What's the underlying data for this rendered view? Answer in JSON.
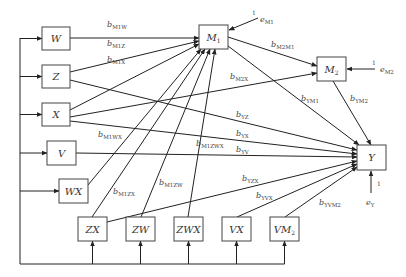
{
  "diagram": {
    "type": "path-model",
    "nodes": [
      {
        "id": "W",
        "label": "W",
        "x": 42,
        "y": 27,
        "w": 28,
        "h": 23
      },
      {
        "id": "Z",
        "label": "Z",
        "x": 42,
        "y": 65,
        "w": 28,
        "h": 23
      },
      {
        "id": "X",
        "label": "X",
        "x": 42,
        "y": 103,
        "w": 28,
        "h": 23
      },
      {
        "id": "V",
        "label": "V",
        "x": 47,
        "y": 141,
        "w": 29,
        "h": 24
      },
      {
        "id": "WX",
        "label": "WX",
        "x": 59,
        "y": 179,
        "w": 29,
        "h": 24
      },
      {
        "id": "ZX",
        "label": "ZX",
        "x": 78,
        "y": 217,
        "w": 29,
        "h": 24
      },
      {
        "id": "ZW",
        "label": "ZW",
        "x": 126,
        "y": 217,
        "w": 29,
        "h": 24
      },
      {
        "id": "ZWX",
        "label": "ZWX",
        "x": 174,
        "y": 217,
        "w": 29,
        "h": 24
      },
      {
        "id": "VX",
        "label": "VX",
        "x": 222,
        "y": 217,
        "w": 29,
        "h": 24
      },
      {
        "id": "VM2",
        "label": "VM",
        "label_sub": "2",
        "x": 270,
        "y": 217,
        "w": 29,
        "h": 24
      },
      {
        "id": "M1",
        "label": "M",
        "label_sub": "1",
        "x": 199,
        "y": 25,
        "w": 29,
        "h": 24
      },
      {
        "id": "M2",
        "label": "M",
        "label_sub": "2",
        "x": 317,
        "y": 57,
        "w": 29,
        "h": 24
      },
      {
        "id": "Y",
        "label": "Y",
        "x": 357,
        "y": 145,
        "w": 29,
        "h": 25
      }
    ],
    "edges": [
      {
        "from": "W",
        "to": "M1",
        "label": "b",
        "sub": "M1W"
      },
      {
        "from": "Z",
        "to": "M1",
        "label": "b",
        "sub": "M1Z"
      },
      {
        "from": "X",
        "to": "M1",
        "label": "b",
        "sub": "M1X"
      },
      {
        "from": "WX",
        "to": "M1",
        "label": "b",
        "sub": "M1WX"
      },
      {
        "from": "ZX",
        "to": "M1",
        "label": "b",
        "sub": "M1ZX"
      },
      {
        "from": "ZW",
        "to": "M1",
        "label": "b",
        "sub": "M1ZW"
      },
      {
        "from": "ZWX",
        "to": "M1",
        "label": "b",
        "sub": "M1ZWX"
      },
      {
        "from": "M1",
        "to": "M2",
        "label": "b",
        "sub": "M2M1"
      },
      {
        "from": "X",
        "to": "M2",
        "label": "b",
        "sub": "M2X"
      },
      {
        "from": "M1",
        "to": "Y",
        "label": "b",
        "sub": "YM1"
      },
      {
        "from": "M2",
        "to": "Y",
        "label": "b",
        "sub": "YM2"
      },
      {
        "from": "Z",
        "to": "Y",
        "label": "b",
        "sub": "YZ"
      },
      {
        "from": "X",
        "to": "Y",
        "label": "b",
        "sub": "YX"
      },
      {
        "from": "V",
        "to": "Y",
        "label": "b",
        "sub": "YV"
      },
      {
        "from": "ZX",
        "to": "Y",
        "label": "b",
        "sub": "YZX"
      },
      {
        "from": "VX",
        "to": "Y",
        "label": "b",
        "sub": "YVX"
      },
      {
        "from": "VM2",
        "to": "Y",
        "label": "b",
        "sub": "YVM2"
      }
    ],
    "errors": [
      {
        "to": "M1",
        "label": "e",
        "sub": "M1",
        "weight": "1"
      },
      {
        "to": "M2",
        "label": "e",
        "sub": "M2",
        "weight": "1"
      },
      {
        "to": "Y",
        "label": "e",
        "sub": "Y",
        "weight": "1"
      }
    ],
    "input_bus": "left trunk and bottom bus feed all exogenous predictors"
  }
}
